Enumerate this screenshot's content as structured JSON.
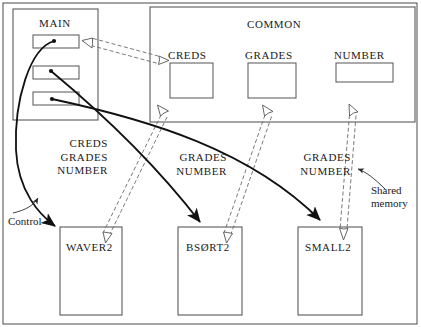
{
  "diagram": {
    "title_main": "MAIN",
    "title_common": "COMMON",
    "common_vars": [
      {
        "label": "CREDS"
      },
      {
        "label": "GRADES"
      },
      {
        "label": "NUMBER"
      }
    ],
    "subprograms": [
      {
        "label": "WAVER2"
      },
      {
        "label": "BSØRT2"
      },
      {
        "label": "SMALL2"
      }
    ],
    "flow_labels": [
      {
        "line1": "CREDS",
        "line2": "GRADES",
        "line3": "NUMBER"
      },
      {
        "line1": "GRADES",
        "line2": "NUMBER"
      },
      {
        "line1": "GRADES",
        "line2": "NUMBER"
      }
    ],
    "annotations": {
      "control": "Control",
      "shared_memory_line1": "Shared",
      "shared_memory_line2": "memory"
    },
    "colors": {
      "stroke": "#3b3b3b",
      "solid_arrow": "#111111",
      "text": "#1a1a1a",
      "background": "#ffffff"
    }
  }
}
